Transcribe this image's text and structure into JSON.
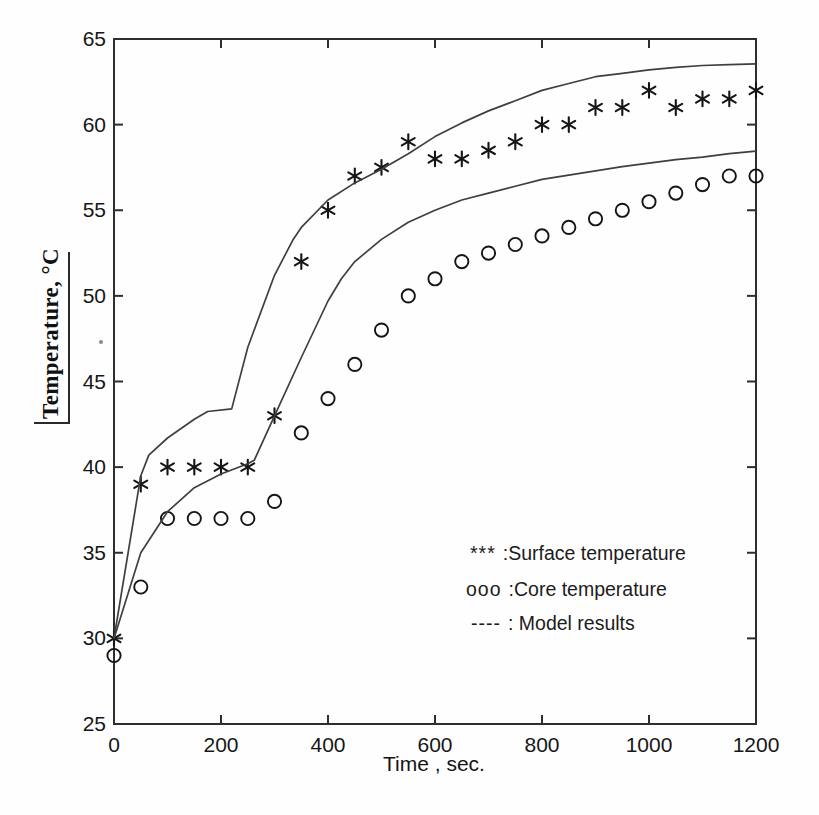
{
  "chart_data": {
    "type": "line",
    "title": "",
    "xlabel": "Time , sec.",
    "ylabel": "Temperature, °C",
    "xlim": [
      0,
      1200
    ],
    "ylim": [
      25,
      65
    ],
    "xticks": [
      0,
      200,
      400,
      600,
      800,
      1000,
      1200
    ],
    "yticks": [
      25,
      30,
      35,
      40,
      45,
      50,
      55,
      60,
      65
    ],
    "grid": false,
    "legend_position": "inside-lower-right",
    "legend": [
      {
        "symbol": "***",
        "label": ":Surface temperature"
      },
      {
        "symbol": "ooo",
        "label": ":Core temperature"
      },
      {
        "symbol": "----",
        "label": ": Model results"
      }
    ],
    "series": [
      {
        "name": "Surface temperature",
        "style": "scatter",
        "marker": "asterisk",
        "points": [
          [
            0,
            30
          ],
          [
            50,
            39
          ],
          [
            100,
            40
          ],
          [
            150,
            40
          ],
          [
            200,
            40
          ],
          [
            250,
            40
          ],
          [
            300,
            43
          ],
          [
            350,
            52
          ],
          [
            400,
            55
          ],
          [
            450,
            57
          ],
          [
            500,
            57.5
          ],
          [
            550,
            59
          ],
          [
            600,
            58
          ],
          [
            650,
            58
          ],
          [
            700,
            58.5
          ],
          [
            750,
            59
          ],
          [
            800,
            60
          ],
          [
            850,
            60
          ],
          [
            900,
            61
          ],
          [
            950,
            61
          ],
          [
            1000,
            62
          ],
          [
            1050,
            61
          ],
          [
            1100,
            61.5
          ],
          [
            1150,
            61.5
          ],
          [
            1200,
            62
          ]
        ]
      },
      {
        "name": "Core temperature",
        "style": "scatter",
        "marker": "circle",
        "points": [
          [
            0,
            29
          ],
          [
            50,
            33
          ],
          [
            100,
            37
          ],
          [
            150,
            37
          ],
          [
            200,
            37
          ],
          [
            250,
            37
          ],
          [
            300,
            38
          ],
          [
            350,
            42
          ],
          [
            400,
            44
          ],
          [
            450,
            46
          ],
          [
            500,
            48
          ],
          [
            550,
            50
          ],
          [
            600,
            51
          ],
          [
            650,
            52
          ],
          [
            700,
            52.5
          ],
          [
            750,
            53
          ],
          [
            800,
            53.5
          ],
          [
            850,
            54
          ],
          [
            900,
            54.5
          ],
          [
            950,
            55
          ],
          [
            1000,
            55.5
          ],
          [
            1050,
            56
          ],
          [
            1100,
            56.5
          ],
          [
            1150,
            57
          ],
          [
            1200,
            57
          ]
        ]
      },
      {
        "name": "Model results (surface)",
        "style": "line",
        "points": [
          [
            0,
            30
          ],
          [
            50,
            39.5
          ],
          [
            65,
            40.7
          ],
          [
            100,
            41.7
          ],
          [
            150,
            42.8
          ],
          [
            175,
            43.25
          ],
          [
            220,
            43.4
          ],
          [
            250,
            47
          ],
          [
            300,
            51.2
          ],
          [
            335,
            53.3
          ],
          [
            350,
            54
          ],
          [
            400,
            55.6
          ],
          [
            450,
            56.6
          ],
          [
            500,
            57.4
          ],
          [
            550,
            58.3
          ],
          [
            600,
            59.3
          ],
          [
            650,
            60.1
          ],
          [
            700,
            60.8
          ],
          [
            750,
            61.4
          ],
          [
            800,
            62
          ],
          [
            850,
            62.4
          ],
          [
            900,
            62.8
          ],
          [
            950,
            63
          ],
          [
            1000,
            63.2
          ],
          [
            1050,
            63.35
          ],
          [
            1100,
            63.45
          ],
          [
            1150,
            63.5
          ],
          [
            1200,
            63.55
          ]
        ]
      },
      {
        "name": "Model results (core)",
        "style": "line",
        "points": [
          [
            0,
            30
          ],
          [
            50,
            35
          ],
          [
            100,
            37.4
          ],
          [
            150,
            38.8
          ],
          [
            200,
            39.6
          ],
          [
            250,
            40.2
          ],
          [
            262,
            40.4
          ],
          [
            300,
            43
          ],
          [
            350,
            46.4
          ],
          [
            400,
            49.7
          ],
          [
            425,
            51
          ],
          [
            450,
            52
          ],
          [
            500,
            53.3
          ],
          [
            550,
            54.3
          ],
          [
            600,
            55
          ],
          [
            650,
            55.6
          ],
          [
            700,
            56
          ],
          [
            750,
            56.4
          ],
          [
            800,
            56.8
          ],
          [
            850,
            57.05
          ],
          [
            900,
            57.3
          ],
          [
            950,
            57.55
          ],
          [
            1000,
            57.75
          ],
          [
            1050,
            57.95
          ],
          [
            1100,
            58.1
          ],
          [
            1150,
            58.3
          ],
          [
            1200,
            58.45
          ]
        ]
      }
    ],
    "colors": {
      "frame": "#2e2e2e",
      "line": "#3f3f3f",
      "marker": "#151515",
      "tick_text": "#161616"
    }
  }
}
